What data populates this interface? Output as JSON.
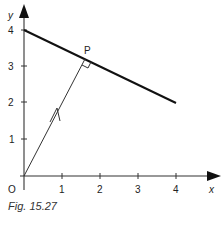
{
  "figure": {
    "caption": "Fig. 15.27",
    "axes": {
      "x_label": "x",
      "y_label": "y",
      "origin_label": "O",
      "x_ticks": [
        "1",
        "2",
        "3",
        "4"
      ],
      "y_ticks": [
        "1",
        "2",
        "3",
        "4"
      ]
    },
    "point_label": "P",
    "elements": {
      "line": {
        "from": [
          0,
          4
        ],
        "to": [
          4,
          2
        ],
        "description": "line through (0,4) and (4,2)"
      },
      "vector_OP": {
        "from": [
          0,
          0
        ],
        "to": [
          1.6,
          3.2
        ],
        "arrow_mid": true
      },
      "right_angle_marker_at": "P"
    },
    "colors": {
      "ink": "#222222",
      "background": "#ffffff"
    }
  }
}
